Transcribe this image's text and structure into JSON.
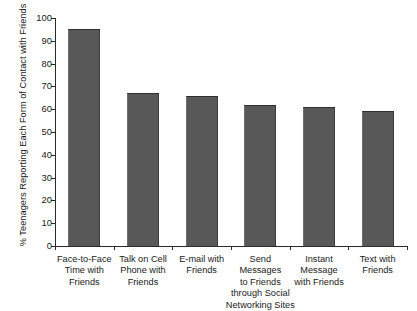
{
  "chart_data": {
    "type": "bar",
    "title": "",
    "subtitle": "",
    "xlabel": "",
    "ylabel": "% Teenagers Reporting Each Form of Contact with Friends",
    "ylim": [
      0,
      100
    ],
    "ytick_step": 10,
    "yticks": [
      "0",
      "10",
      "20",
      "30",
      "40",
      "50",
      "60",
      "70",
      "80",
      "90",
      "100"
    ],
    "grid": false,
    "legend": false,
    "bar_color": "#585858",
    "axis_color": "#2b2b2b",
    "categories": [
      "Face-to-Face\nTime with\nFriends",
      "Talk on Cell\nPhone with\nFriends",
      "E-mail with\nFriends",
      "Send\nMessages\nto Friends\nthrough Social\nNetworking Sites",
      "Instant\nMessage\nwith Friends",
      "Text with\nFriends"
    ],
    "values": [
      95,
      67,
      66,
      62,
      61,
      59
    ]
  }
}
